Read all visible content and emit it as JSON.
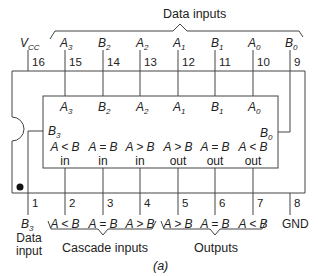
{
  "figure": {
    "caption": "(a)",
    "group_labels": {
      "data_inputs": "Data inputs",
      "cascade_inputs": "Cascade inputs",
      "outputs": "Outputs",
      "data_input_b3_line1": "Data",
      "data_input_b3_line2": "input"
    },
    "top_pins": [
      {
        "num": "16",
        "name": "V",
        "sub": "CC"
      },
      {
        "num": "15",
        "name": "A",
        "sub": "3"
      },
      {
        "num": "14",
        "name": "B",
        "sub": "2"
      },
      {
        "num": "13",
        "name": "A",
        "sub": "2"
      },
      {
        "num": "12",
        "name": "A",
        "sub": "1"
      },
      {
        "num": "11",
        "name": "B",
        "sub": "1"
      },
      {
        "num": "10",
        "name": "A",
        "sub": "0"
      },
      {
        "num": "9",
        "name": "B",
        "sub": "0"
      }
    ],
    "bottom_pins": [
      {
        "num": "1",
        "name": "B",
        "sub": "3"
      },
      {
        "num": "2",
        "name": "A < B"
      },
      {
        "num": "3",
        "name": "A = B"
      },
      {
        "num": "4",
        "name": "A > B"
      },
      {
        "num": "5",
        "name": "A > B"
      },
      {
        "num": "6",
        "name": "A = B"
      },
      {
        "num": "7",
        "name": "A < B"
      },
      {
        "num": "8",
        "name": "GND"
      }
    ],
    "inner_block": {
      "top_labels": [
        {
          "name": "A",
          "sub": "3"
        },
        {
          "name": "B",
          "sub": "2"
        },
        {
          "name": "A",
          "sub": "2"
        },
        {
          "name": "A",
          "sub": "1"
        },
        {
          "name": "B",
          "sub": "1"
        },
        {
          "name": "A",
          "sub": "0"
        }
      ],
      "left_label": {
        "name": "B",
        "sub": "3"
      },
      "right_label": {
        "name": "B",
        "sub": "0"
      },
      "bottom_labels": [
        {
          "expr": "A < B",
          "kind": "in"
        },
        {
          "expr": "A = B",
          "kind": "in"
        },
        {
          "expr": "A > B",
          "kind": "in"
        },
        {
          "expr": "A > B",
          "kind": "out"
        },
        {
          "expr": "A = B",
          "kind": "out"
        },
        {
          "expr": "A < B",
          "kind": "out"
        }
      ]
    }
  }
}
